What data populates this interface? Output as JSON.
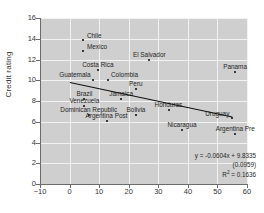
{
  "chart_data": {
    "type": "scatter",
    "title": "",
    "xlabel": "",
    "ylabel": "Credit rating",
    "xlim": [
      -10,
      60
    ],
    "ylim": [
      0,
      16
    ],
    "xticks": [
      -10,
      0,
      10,
      20,
      30,
      40,
      50,
      60
    ],
    "yticks": [
      0,
      2,
      4,
      6,
      8,
      10,
      12,
      14,
      16
    ],
    "grid": true,
    "legend": "none",
    "points": [
      {
        "label": "Chile",
        "x": 4.5,
        "y": 13.9
      },
      {
        "label": "Mexico",
        "x": 4.5,
        "y": 12.8
      },
      {
        "label": "El Salvador",
        "x": 27.0,
        "y": 12.0
      },
      {
        "label": "Panama",
        "x": 56.0,
        "y": 10.8
      },
      {
        "label": "Costa Rica",
        "x": 9.5,
        "y": 11.0
      },
      {
        "label": "Guatemala",
        "x": 8.0,
        "y": 10.0
      },
      {
        "label": "Colombia",
        "x": 13.0,
        "y": 10.0
      },
      {
        "label": "Peru",
        "x": 22.5,
        "y": 9.2
      },
      {
        "label": "Brazil",
        "x": 5.0,
        "y": 8.2
      },
      {
        "label": "Jamaica",
        "x": 17.5,
        "y": 8.2
      },
      {
        "label": "Venezuela",
        "x": 5.0,
        "y": 7.5
      },
      {
        "label": "Dominican Republic",
        "x": 6.5,
        "y": 6.7
      },
      {
        "label": "Bolivia",
        "x": 22.5,
        "y": 6.7
      },
      {
        "label": "Honduras",
        "x": 33.5,
        "y": 7.1
      },
      {
        "label": "Argentina Post",
        "x": 12.5,
        "y": 6.1
      },
      {
        "label": "Uruguay",
        "x": 55.0,
        "y": 6.4
      },
      {
        "label": "Nicaragua",
        "x": 38.0,
        "y": 5.2
      },
      {
        "label": "Argentina Pre",
        "x": 56.0,
        "y": 4.8
      }
    ],
    "trendline": {
      "slope": -0.0604,
      "intercept": 9.8335,
      "x_start": 0,
      "x_end": 55
    },
    "annotations": {
      "equation": "y = -0.0604x + 9.8335",
      "standard_error": "(0.0959)",
      "r_squared_label": "R",
      "r_squared_sup": "2",
      "r_squared_value": " = 0.1636"
    },
    "colors": {
      "plot_background": "#cfcfcf",
      "gridline": "#f2f2f2",
      "axis": "#6b6b6b",
      "point": "#3a3a3a",
      "trendline": "#111111",
      "text": "#1f1f1f"
    }
  }
}
